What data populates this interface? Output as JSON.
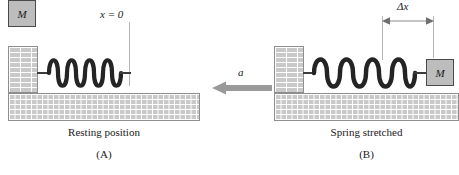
{
  "figure": {
    "type": "physics-diagram",
    "panels": [
      {
        "id": "A",
        "caption": "Resting position",
        "tag": "(A)",
        "mass_label": "M",
        "position_label": "x = 0",
        "spring_state": "relaxed",
        "coils": 7
      },
      {
        "id": "B",
        "caption": "Spring stretched",
        "tag": "(B)",
        "mass_label": "M",
        "displacement_label": "Δx",
        "spring_state": "stretched",
        "coils": 7
      }
    ],
    "acceleration_label": "a",
    "colors": {
      "brick_fill": "#c9c9c9",
      "brick_mortar": "#ffffff",
      "brick_outline": "#8e8e8e",
      "mass_fill": "#bdbdbd",
      "mass_outline": "#4a4a4a",
      "spring": "#242424",
      "arrow": "#9a9a9a",
      "guide_line": "#b4b4b4",
      "text": "#1a1a1a",
      "background": "#ffffff"
    }
  }
}
